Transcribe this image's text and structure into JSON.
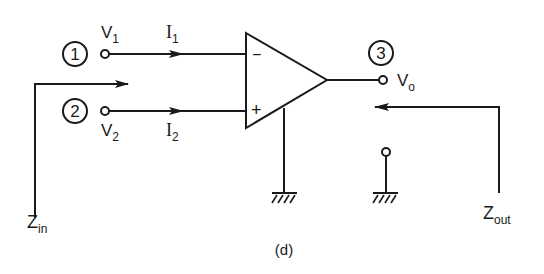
{
  "diagram": {
    "type": "op-amp impedance diagram",
    "caption": "(d)",
    "nodes": [
      {
        "id": "1",
        "label": "1",
        "voltage": {
          "main": "V",
          "sub": "1"
        },
        "current": {
          "main": "I",
          "sub": "1"
        }
      },
      {
        "id": "2",
        "label": "2",
        "voltage": {
          "main": "V",
          "sub": "2"
        },
        "current": {
          "main": "I",
          "sub": "2"
        }
      },
      {
        "id": "3",
        "label": "3",
        "voltage": {
          "main": "V",
          "sub": "o"
        }
      }
    ],
    "opamp": {
      "inverting": "−",
      "non_inverting": "+"
    },
    "impedances": {
      "input": {
        "main": "Z",
        "sub": "in"
      },
      "output": {
        "main": "Z",
        "sub": "out"
      }
    },
    "colors": {
      "line": "#1a1a1a",
      "background": "#ffffff"
    }
  }
}
